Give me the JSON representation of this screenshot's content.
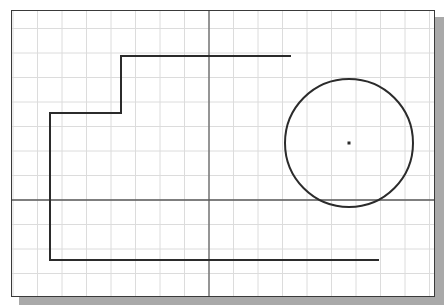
{
  "drawing": {
    "frame": {
      "x": 11,
      "y": 10,
      "width": 424,
      "height": 287
    },
    "grid": {
      "spacing": 24.5,
      "origin_x": 209,
      "origin_y": 200,
      "color": "#dcdcdc"
    },
    "axes": {
      "x_axis_y": 200,
      "y_axis_x": 209,
      "color": "#5a5a5a"
    },
    "polyline": {
      "points": "291,56 121,56 121,113 50,113 50,260 379,260",
      "color": "#2b2b2b"
    },
    "circle": {
      "cx": 349,
      "cy": 143,
      "r": 64,
      "color": "#2b2b2b"
    },
    "center_point": {
      "cx": 349,
      "cy": 143
    }
  }
}
